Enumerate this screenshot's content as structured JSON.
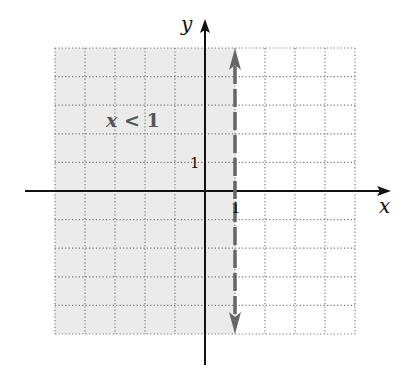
{
  "chart_data": {
    "type": "inequality-graph",
    "title": "",
    "inequality": "x < 1",
    "xlabel": "x",
    "ylabel": "y",
    "xlim": [
      -5,
      5
    ],
    "ylim": [
      -5,
      5
    ],
    "grid": true,
    "grid_style": "dotted",
    "boundary": {
      "type": "vertical-line",
      "x": 1,
      "style": "dashed",
      "arrows": "both",
      "included": false
    },
    "shaded_region": {
      "side": "left",
      "condition": "x < 1"
    },
    "tick_labels": [
      {
        "axis": "x",
        "value": 1,
        "label": "1"
      },
      {
        "axis": "y",
        "value": 1,
        "label": "1"
      }
    ],
    "annotations": [
      {
        "text": "x < 1",
        "x": -3.1,
        "y": 3.5
      }
    ]
  },
  "labels": {
    "x_axis": "x",
    "y_axis": "y",
    "x_tick_one": "1",
    "y_tick_one": "1",
    "region_var": "x",
    "region_rest": " < 1"
  },
  "colors": {
    "shade": "#ebebeb",
    "grid": "#777777",
    "axis": "#111111",
    "boundary": "#666666"
  }
}
